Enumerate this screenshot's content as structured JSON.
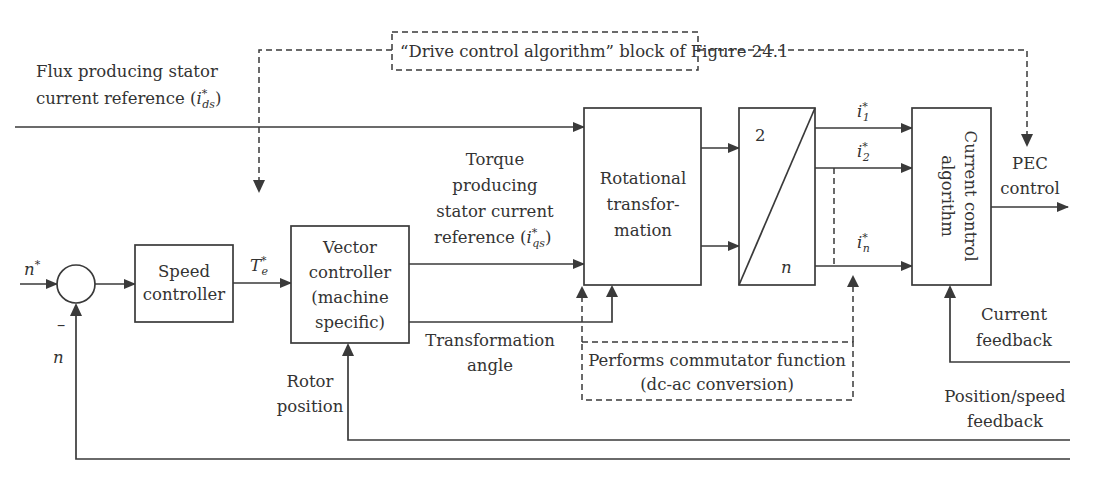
{
  "diagram": {
    "type": "block-diagram",
    "colors": {
      "stroke": "#3a3a3a",
      "text": "#333333",
      "background": "#ffffff"
    },
    "annotations": {
      "drive_block": "“Drive control algorithm” block of Figure 24.1",
      "commutator_line1": "Performs commutator function",
      "commutator_line2": "(dc-ac conversion)"
    },
    "signals": {
      "flux_line1": "Flux producing stator",
      "flux_line2": "current reference (",
      "flux_sym": "i",
      "flux_sub": "ds",
      "flux_sup": "*",
      "flux_close": ")",
      "torque_line1": "Torque",
      "torque_line2": "producing",
      "torque_line3": "stator current",
      "torque_line4": "reference (",
      "torque_sym": "i",
      "torque_sub": "qs",
      "torque_sup": "*",
      "torque_close": ")",
      "n_star": "n",
      "n_star_sup": "*",
      "minus": "–",
      "n": "n",
      "te_sym": "T",
      "te_sub": "e",
      "te_sup": "*",
      "angle_line1": "Transformation",
      "angle_line2": "angle",
      "rotor_line1": "Rotor",
      "rotor_line2": "position",
      "i1_sym": "i",
      "i1_sub": "1",
      "i2_sym": "i",
      "i2_sub": "2",
      "in_sym": "i",
      "in_sub": "n",
      "i_sup": "*",
      "pec_line1": "PEC",
      "pec_line2": "control",
      "current_fb_line1": "Current",
      "current_fb_line2": "feedback",
      "pos_fb_line1": "Position/speed",
      "pos_fb_line2": "feedback"
    },
    "blocks": {
      "speed_controller": [
        "Speed",
        "controller"
      ],
      "vector_controller": [
        "Vector",
        "controller",
        "(machine",
        "specific)"
      ],
      "rotational": [
        "Rotational",
        "transfor-",
        "mation"
      ],
      "phase_converter_top": "2",
      "phase_converter_bottom": "n",
      "current_control": [
        "Current control",
        "algorithm"
      ]
    }
  }
}
